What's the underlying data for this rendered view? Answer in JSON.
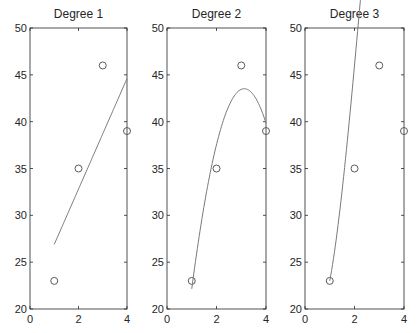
{
  "figure": {
    "background": "#ffffff",
    "axis_color": "#262626",
    "line_color": "#7a7a7a",
    "marker_color": "#5a5a5a"
  },
  "chart_data": [
    {
      "type": "line",
      "title": "Degree 1",
      "xlabel": "",
      "ylabel": "",
      "xlim": [
        0,
        4
      ],
      "ylim": [
        20,
        50
      ],
      "xticks": [
        0,
        2,
        4
      ],
      "yticks": [
        20,
        25,
        30,
        35,
        40,
        45,
        50
      ],
      "grid": false,
      "series": [
        {
          "name": "data",
          "style": "markers",
          "x": [
            1,
            2,
            3,
            4
          ],
          "y": [
            23,
            35,
            46,
            39
          ]
        },
        {
          "name": "fit",
          "style": "line",
          "degree": 1,
          "coefficients_low_to_high": [
            21,
            5.9
          ],
          "x_range": [
            1,
            4
          ]
        }
      ]
    },
    {
      "type": "line",
      "title": "Degree 2",
      "xlabel": "",
      "ylabel": "",
      "xlim": [
        0,
        4
      ],
      "ylim": [
        20,
        50
      ],
      "xticks": [
        0,
        2,
        4
      ],
      "yticks": [
        20,
        25,
        30,
        35,
        40,
        45,
        50
      ],
      "grid": false,
      "series": [
        {
          "name": "data",
          "style": "markers",
          "x": [
            1,
            2,
            3,
            4
          ],
          "y": [
            23,
            35,
            46,
            39
          ]
        },
        {
          "name": "fit",
          "style": "line",
          "degree": 2,
          "coefficients_low_to_high": [
            -2.75,
            29.65,
            -4.75
          ],
          "x_range": [
            1,
            4
          ]
        }
      ]
    },
    {
      "type": "line",
      "title": "Degree 3",
      "xlabel": "",
      "ylabel": "",
      "xlim": [
        0,
        4
      ],
      "ylim": [
        20,
        50
      ],
      "xticks": [
        0,
        2,
        4
      ],
      "yticks": [
        20,
        25,
        30,
        35,
        40,
        45,
        50
      ],
      "grid": false,
      "series": [
        {
          "name": "data",
          "style": "markers",
          "x": [
            1,
            2,
            3,
            4
          ],
          "y": [
            23,
            35,
            46,
            39
          ]
        },
        {
          "name": "fit",
          "style": "line",
          "degree": 3,
          "coefficients_low_to_high": [
            24,
            -19.1667,
            21.25,
            -3.0833
          ],
          "x_range": [
            1,
            4
          ]
        }
      ]
    }
  ],
  "layout": {
    "panels": [
      {
        "left": 30,
        "right": 127,
        "top": 28,
        "bottom": 309
      },
      {
        "left": 167,
        "right": 266,
        "top": 28,
        "bottom": 309
      },
      {
        "left": 305,
        "right": 404,
        "top": 28,
        "bottom": 309
      }
    ]
  }
}
